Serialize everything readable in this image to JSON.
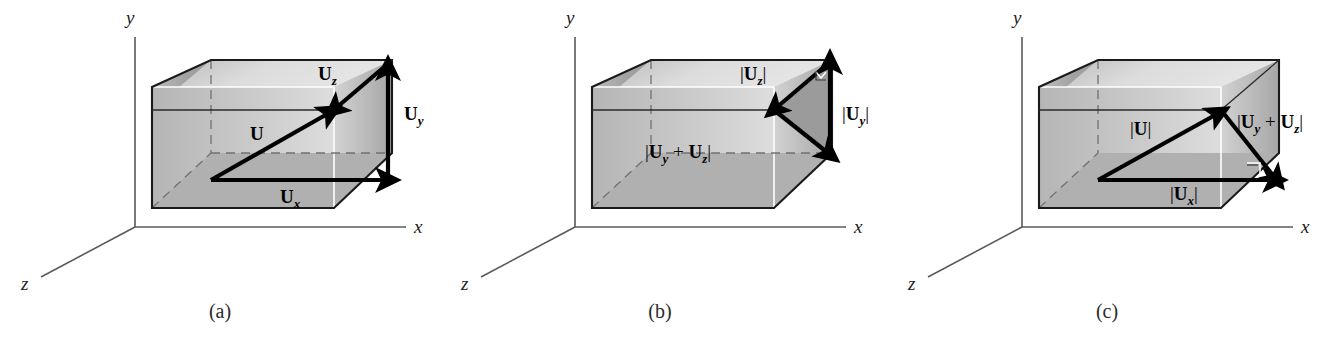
{
  "figure": {
    "background_color": "#ffffff",
    "width": 1337,
    "height": 339
  },
  "style": {
    "edge_color": "#1a1a1a",
    "axis_color": "#5a5a5a",
    "hidden_edge_color": "#707070",
    "vector_color": "#000000",
    "face_left_color": "#a8a8a8",
    "face_top_color": "#d8d8d8",
    "face_front_color": "#c4c4c4",
    "face_right_color": "#9b9b9b",
    "highlight_color": "#ffffff"
  },
  "axes": {
    "y_label": "y",
    "x_label": "x",
    "z_label": "z"
  },
  "panels": [
    {
      "id": "a",
      "caption": "(a)",
      "labels": [
        {
          "name": "vector-u",
          "base": "U",
          "sub": "",
          "bars": false,
          "text": "U"
        },
        {
          "name": "vector-ux",
          "base": "U",
          "sub": "x",
          "bars": false,
          "text": "Ux"
        },
        {
          "name": "vector-uy",
          "base": "U",
          "sub": "y",
          "bars": false,
          "text": "Uy"
        },
        {
          "name": "vector-uz",
          "base": "U",
          "sub": "z",
          "bars": false,
          "text": "Uz"
        }
      ]
    },
    {
      "id": "b",
      "caption": "(b)",
      "labels": [
        {
          "name": "magnitude-uz",
          "base": "U",
          "sub": "z",
          "bars": true,
          "text": "|Uz|"
        },
        {
          "name": "magnitude-uy",
          "base": "U",
          "sub": "y",
          "bars": true,
          "text": "|Uy|"
        },
        {
          "name": "magnitude-uy-plus-uz",
          "base": "U",
          "sub": "y+z",
          "bars": true,
          "text": "|Uy + Uz|"
        }
      ]
    },
    {
      "id": "c",
      "caption": "(c)",
      "labels": [
        {
          "name": "magnitude-u",
          "base": "U",
          "sub": "",
          "bars": true,
          "text": "|U|"
        },
        {
          "name": "magnitude-ux",
          "base": "U",
          "sub": "x",
          "bars": true,
          "text": "|Ux|"
        },
        {
          "name": "magnitude-uy-plus-uz",
          "base": "U",
          "sub": "y+z",
          "bars": true,
          "text": "|Uy + Uz|"
        }
      ]
    }
  ],
  "text": {
    "panel_a": {
      "caption": "(a)",
      "u": "U",
      "u_sub": "",
      "ux_base": "U",
      "ux_sub": "x",
      "uy_base": "U",
      "uy_sub": "y",
      "uz_base": "U",
      "uz_sub": "z",
      "axis_y": "y",
      "axis_x": "x",
      "axis_z": "z"
    },
    "panel_b": {
      "caption": "(b)",
      "uz_open": "|",
      "uz_base": "U",
      "uz_sub": "z",
      "uz_close": "|",
      "uy_open": "|",
      "uy_base": "U",
      "uy_sub": "y",
      "uy_close": "|",
      "sum_open": "|",
      "sum_base1": "U",
      "sum_sub1": "y",
      "sum_plus": " + ",
      "sum_base2": "U",
      "sum_sub2": "z",
      "sum_close": "|",
      "axis_y": "y",
      "axis_x": "x",
      "axis_z": "z"
    },
    "panel_c": {
      "caption": "(c)",
      "u_open": "|",
      "u_base": "U",
      "u_close": "|",
      "ux_open": "|",
      "ux_base": "U",
      "ux_sub": "x",
      "ux_close": "|",
      "sum_open": "|",
      "sum_base1": "U",
      "sum_sub1": "y",
      "sum_plus": " + ",
      "sum_base2": "U",
      "sum_sub2": "z",
      "sum_close": "|",
      "axis_y": "y",
      "axis_x": "x",
      "axis_z": "z"
    }
  }
}
